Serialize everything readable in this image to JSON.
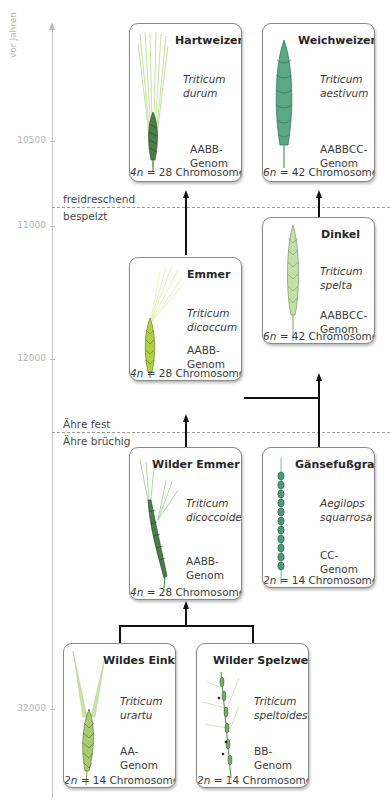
{
  "axis": {
    "title": "vor Jahren",
    "ticks": [
      "10500",
      "11000",
      "12000",
      "32000"
    ]
  },
  "dividers": [
    {
      "above": "freidreschend",
      "below": "bespelzt"
    },
    {
      "above": "Ähre fest",
      "below": "Ähre brüchig"
    }
  ],
  "species": [
    {
      "id": "hartweizen",
      "name": "Hartweizen",
      "latin": [
        "Triticum",
        "durum"
      ],
      "genome": [
        "AABB-",
        "Genom"
      ],
      "ploidy": "4n",
      "chromosomes": "= 28 Chromosomen"
    },
    {
      "id": "weichweizen",
      "name": "Weichweizen",
      "latin": [
        "Triticum",
        "aestivum"
      ],
      "genome": [
        "AABBCC-",
        "Genom"
      ],
      "ploidy": "6n",
      "chromosomes": "= 42 Chromosomen"
    },
    {
      "id": "dinkel",
      "name": "Dinkel",
      "latin": [
        "Triticum",
        "spelta"
      ],
      "genome": [
        "AABBCC-",
        "Genom"
      ],
      "ploidy": "6n",
      "chromosomes": "= 42 Chromosomen"
    },
    {
      "id": "emmer",
      "name": "Emmer",
      "latin": [
        "Triticum",
        "dicoccum"
      ],
      "genome": [
        "AABB-",
        "Genom"
      ],
      "ploidy": "4n",
      "chromosomes": "= 28 Chromosomen"
    },
    {
      "id": "wilder-emmer",
      "name": "Wilder Emmer",
      "latin": [
        "Triticum",
        "dicoccoides"
      ],
      "genome": [
        "AABB-",
        "Genom"
      ],
      "ploidy": "4n",
      "chromosomes": "= 28 Chromosomen"
    },
    {
      "id": "gaensefussgras",
      "name": "Gänsefußgras",
      "latin": [
        "Aegilops",
        "squarrosa"
      ],
      "genome": [
        "CC-",
        "Genom"
      ],
      "ploidy": "2n",
      "chromosomes": "= 14 Chromosomen"
    },
    {
      "id": "wildes-einkorn",
      "name": "Wildes Einkorn",
      "latin": [
        "Triticum",
        "urartu"
      ],
      "genome": [
        "AA-",
        "Genom"
      ],
      "ploidy": "2n",
      "chromosomes": "= 14 Chromosomen"
    },
    {
      "id": "wilder-spelzweizen",
      "name": "Wilder Spelzweizen",
      "latin": [
        "Triticum",
        "speltoides"
      ],
      "genome": [
        "BB-",
        "Genom"
      ],
      "ploidy": "2n",
      "chromosomes": "= 14 Chromosomen"
    }
  ],
  "relations": [
    {
      "from": [
        "wildes-einkorn",
        "wilder-spelzweizen"
      ],
      "to": "wilder-emmer"
    },
    {
      "from": [
        "wilder-emmer"
      ],
      "to": "emmer"
    },
    {
      "from": [
        "emmer"
      ],
      "to": "hartweizen"
    },
    {
      "from": [
        "emmer",
        "gaensefussgras"
      ],
      "to": "dinkel"
    },
    {
      "from": [
        "dinkel"
      ],
      "to": "weichweizen"
    }
  ],
  "colors": {
    "connector": "#111111",
    "axis": "#c4c4c4",
    "plant_light": "#b9d98a",
    "plant_dark": "#3f6b3a",
    "plant_teal": "#5aa889"
  }
}
